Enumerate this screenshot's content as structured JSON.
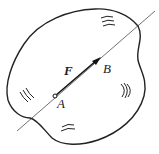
{
  "diagram": {
    "type": "rigid-body-force-line-of-action",
    "labels": {
      "force": "F",
      "point_a": "A",
      "point_b": "B"
    },
    "colors": {
      "stroke": "#222222",
      "background": "#ffffff"
    },
    "elements": {
      "body_outline": "irregular closed curve (rigid body)",
      "line_of_action": "thin straight line through A and B extending beyond body",
      "force_vector": "bold arrow from A to B",
      "point_a_marker": "small hollow circle",
      "texture_marks": [
        "top",
        "left",
        "right",
        "bottom"
      ]
    }
  }
}
